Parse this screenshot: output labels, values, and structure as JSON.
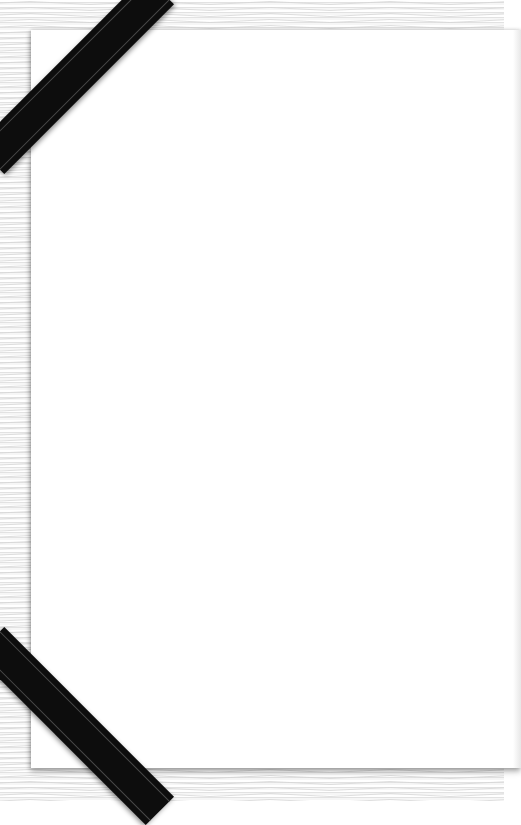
{
  "card": {
    "type": "condolence-card",
    "background_color": "#ffffff",
    "border_pattern": "wavy-guilloche-lines",
    "border_color": "#e2e2e2"
  },
  "ribbons": [
    {
      "position": "top-left",
      "color": "#0d0d0d"
    },
    {
      "position": "bottom-left",
      "color": "#0d0d0d"
    }
  ]
}
